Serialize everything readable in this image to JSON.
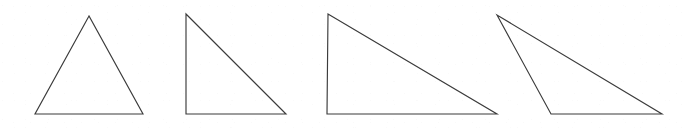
{
  "figure": {
    "width": 689,
    "height": 137,
    "background_color": "#ffffff",
    "stroke_color": "#3b3b3b",
    "fill_color": "#ffffff",
    "stroke_width": 1.15
  },
  "chart_data": {
    "type": "diagram",
    "subtitle": "",
    "xlabel": "",
    "ylabel": "",
    "grid": false,
    "legend": "none",
    "axis_ranges": {
      "x": [
        0,
        689
      ],
      "y": [
        0,
        137
      ]
    },
    "units": "pixels",
    "coordinate_origin": "top-left",
    "shape_count": 4,
    "shapes": [
      {
        "name": "triangle-1",
        "label": "Isosceles acute triangle",
        "classification": "acute isosceles",
        "points": [
          [
            89,
            16
          ],
          [
            35,
            114
          ],
          [
            143,
            114
          ]
        ],
        "base_width": 108,
        "height": 98,
        "apex_x": 89,
        "baseline_y": 114
      },
      {
        "name": "triangle-2",
        "label": "Right triangle, moderate slope",
        "classification": "right",
        "points": [
          [
            186,
            14
          ],
          [
            186,
            114
          ],
          [
            286,
            114
          ]
        ],
        "base_width": 100,
        "height": 100,
        "apex_x": 186,
        "baseline_y": 114
      },
      {
        "name": "triangle-3",
        "label": "Right triangle, shallow slope",
        "classification": "right",
        "points": [
          [
            328,
            14
          ],
          [
            327,
            114
          ],
          [
            497,
            114
          ]
        ],
        "base_width": 170,
        "height": 100,
        "apex_x": 328,
        "baseline_y": 114
      },
      {
        "name": "triangle-4",
        "label": "Obtuse scalene triangle, apex left of base",
        "classification": "obtuse scalene",
        "points": [
          [
            497,
            15
          ],
          [
            551,
            114
          ],
          [
            662,
            114
          ]
        ],
        "base_width": 111,
        "height": 99,
        "apex_x": 497,
        "baseline_y": 114
      }
    ],
    "annotations": []
  }
}
